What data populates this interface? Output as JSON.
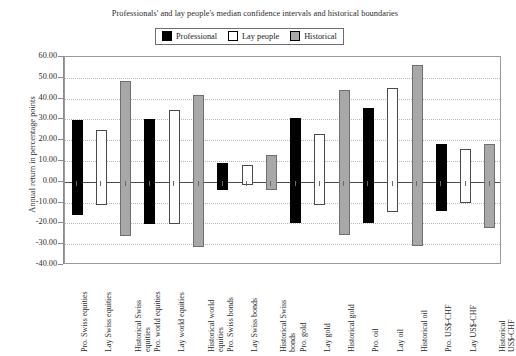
{
  "chart_data": {
    "type": "bar",
    "title": "Professionals' and lay people's median confidence intervals and historical boundaries",
    "xlabel": "",
    "ylabel": "Annual return in percentage points",
    "ylim": [
      -40.0,
      60.0
    ],
    "ytick_step": 10.0,
    "ytick_labels": [
      "60.00",
      "50.00",
      "40.00",
      "30.00",
      "20.00",
      "10.00",
      "0.00",
      "-10.00",
      "-20.00",
      "-30.00",
      "-40.00"
    ],
    "ytick_values": [
      60,
      50,
      40,
      30,
      20,
      10,
      0,
      -10,
      -20,
      -30,
      -40
    ],
    "grid": true,
    "legend_position": "top-center",
    "legend": [
      {
        "label": "Professional",
        "color": "#000000",
        "key": "professional"
      },
      {
        "label": "Lay people",
        "color": "#ffffff",
        "key": "lay"
      },
      {
        "label": "Historical",
        "color": "#a8a8a8",
        "key": "historical"
      }
    ],
    "note": "Each bar is a confidence interval drawn from its lower bound to its upper bound.",
    "categories": [
      "Pro. Swiss equities",
      "Lay Swiss equities",
      "Historical Swiss equities",
      "Pro. world equities",
      "Lay world equities",
      "Historical world equities",
      "Pro. Swiss bonds",
      "Lay Swiss bonds",
      "Historical Swiss bonds",
      "Pro. gold",
      "Lay gold",
      "Historical gold",
      "Pro. oil",
      "Lay oil",
      "Historical oil",
      "Pro. US$-CHF",
      "Lay US$-CHF",
      "Historical US$-CHF"
    ],
    "bars": [
      {
        "category": "Pro. Swiss equities",
        "series": "professional",
        "upper": 29.5,
        "lower": -16.0
      },
      {
        "category": "Lay Swiss equities",
        "series": "lay",
        "upper": 25.0,
        "lower": -11.0
      },
      {
        "category": "Historical Swiss equities",
        "series": "historical",
        "upper": 48.5,
        "lower": -26.0
      },
      {
        "category": "Pro. world equities",
        "series": "professional",
        "upper": 30.0,
        "lower": -20.5
      },
      {
        "category": "Lay world equities",
        "series": "lay",
        "upper": 34.5,
        "lower": -20.5
      },
      {
        "category": "Historical world equities",
        "series": "historical",
        "upper": 41.5,
        "lower": -31.5
      },
      {
        "category": "Pro. Swiss bonds",
        "series": "professional",
        "upper": 9.0,
        "lower": -4.0
      },
      {
        "category": "Lay Swiss bonds",
        "series": "lay",
        "upper": 8.0,
        "lower": -1.5
      },
      {
        "category": "Historical Swiss bonds",
        "series": "historical",
        "upper": 13.0,
        "lower": -4.0
      },
      {
        "category": "Pro. gold",
        "series": "professional",
        "upper": 30.5,
        "lower": -20.0
      },
      {
        "category": "Lay gold",
        "series": "lay",
        "upper": 23.0,
        "lower": -11.0
      },
      {
        "category": "Historical gold",
        "series": "historical",
        "upper": 44.0,
        "lower": -25.5
      },
      {
        "category": "Pro. oil",
        "series": "professional",
        "upper": 35.5,
        "lower": -20.0
      },
      {
        "category": "Lay oil",
        "series": "lay",
        "upper": 45.0,
        "lower": -14.5
      },
      {
        "category": "Historical oil",
        "series": "historical",
        "upper": 56.0,
        "lower": -31.0
      },
      {
        "category": "Pro. US$-CHF",
        "series": "professional",
        "upper": 18.0,
        "lower": -14.0
      },
      {
        "category": "Lay US$-CHF",
        "series": "lay",
        "upper": 16.0,
        "lower": -10.0
      },
      {
        "category": "Historical US$-CHF",
        "series": "historical",
        "upper": 18.0,
        "lower": -22.0
      }
    ]
  },
  "xlabel_lines": [
    [
      "Pro. Swiss equities"
    ],
    [
      "Lay Swiss equities"
    ],
    [
      "Historical Swiss",
      "equities"
    ],
    [
      "Pro. world equities"
    ],
    [
      "Lay world equities"
    ],
    [
      "Historical world",
      "equities"
    ],
    [
      "Pro. Swiss bonds"
    ],
    [
      "Lay Swiss bonds"
    ],
    [
      "Historical Swiss",
      "bonds"
    ],
    [
      "Pro. gold"
    ],
    [
      "Lay gold"
    ],
    [
      "Historical gold"
    ],
    [
      "Pro. oil"
    ],
    [
      "Lay oil"
    ],
    [
      "Historical oil"
    ],
    [
      "Pro. US$-CHF"
    ],
    [
      "Lay US$-CHF"
    ],
    [
      "Historical",
      "US$-CHF"
    ]
  ]
}
